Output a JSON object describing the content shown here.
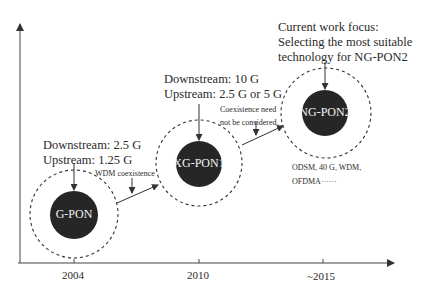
{
  "diagram": {
    "axis": {
      "ticks": [
        {
          "label": "2004",
          "x": 74
        },
        {
          "label": "2010",
          "x": 199
        },
        {
          "label": "~2015",
          "x": 323
        }
      ]
    },
    "nodes": [
      {
        "id": "gpon",
        "label": "G-PON",
        "annotation": [
          "Downstream: 2.5 G",
          "Upstream: 1.25 G"
        ]
      },
      {
        "id": "xgpon1",
        "label": "XG-PON1",
        "annotation": [
          "Downstream: 10 G",
          "Upstream: 2.5 G or 5 G"
        ]
      },
      {
        "id": "ngpon2",
        "label": "NG-PON2",
        "annotation": [
          "Current work focus:",
          "Selecting the most suitable",
          "technology for NG-PON2"
        ],
        "candidates": [
          "ODSM, 40 G, WDM,",
          "OFDMA······"
        ]
      }
    ],
    "transitions": [
      {
        "from": "gpon",
        "to": "xgpon1",
        "note": [
          "WDM coexistence"
        ]
      },
      {
        "from": "xgpon1",
        "to": "ngpon2",
        "note": [
          "Coexistence need",
          "not be considered."
        ]
      }
    ],
    "colors": {
      "node_fill": "#262626",
      "line": "#333333",
      "background": "#ffffff"
    }
  }
}
